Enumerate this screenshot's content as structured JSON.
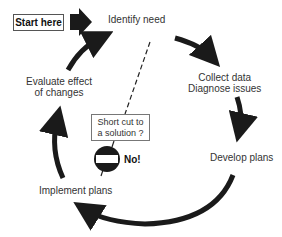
{
  "diagram": {
    "type": "cycle",
    "start_label": "Start here",
    "stages": [
      {
        "id": "identify",
        "label": "Identify need"
      },
      {
        "id": "collect",
        "label_line1": "Collect data",
        "label_line2": "Diagnose issues"
      },
      {
        "id": "develop",
        "label": "Develop plans"
      },
      {
        "id": "implement",
        "label": "Implement plans"
      },
      {
        "id": "evaluate",
        "label_line1": "Evaluate effect",
        "label_line2": "of changes"
      }
    ],
    "shortcut": {
      "question_line1": "Short cut to",
      "question_line2": "a solution ?",
      "answer": "No!",
      "icon": "no-entry-sign"
    },
    "colors": {
      "arrow": "#1a1a1a",
      "text": "#333333",
      "background": "#ffffff"
    }
  }
}
